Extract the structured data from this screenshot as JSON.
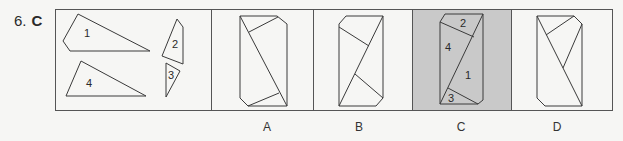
{
  "question": {
    "number": "6.",
    "answer": "C"
  },
  "colors": {
    "line": "#3a3a3a",
    "frame": "#555555",
    "highlight_bg": "#c9c9c9",
    "page_bg": "#f6f6f4"
  },
  "pieces_panel": {
    "pieces": [
      {
        "label": "1"
      },
      {
        "label": "2"
      },
      {
        "label": "3"
      },
      {
        "label": "4"
      }
    ]
  },
  "options": [
    {
      "label": "A",
      "selected": false
    },
    {
      "label": "B",
      "selected": false
    },
    {
      "label": "C",
      "selected": true,
      "piece_labels": [
        "2",
        "4",
        "1",
        "3"
      ]
    },
    {
      "label": "D",
      "selected": false
    }
  ]
}
